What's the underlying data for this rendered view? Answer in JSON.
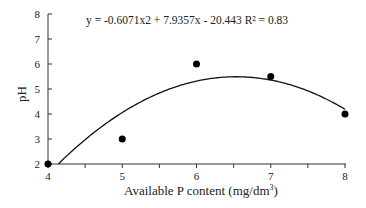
{
  "chart_data": {
    "type": "scatter",
    "title": "",
    "xlabel": "Available P content (mg/dm3)",
    "xlabel_main": "Available P content (mg/dm",
    "xlabel_sup": "3",
    "xlabel_close": ")",
    "ylabel": "pH",
    "xlim": [
      4,
      8
    ],
    "ylim": [
      2,
      8
    ],
    "x_ticks": [
      "4",
      "5",
      "6",
      "7",
      "8"
    ],
    "y_ticks": [
      "2",
      "3",
      "4",
      "5",
      "6",
      "7",
      "8"
    ],
    "grid": false,
    "legend": "none",
    "series": [
      {
        "name": "observed",
        "x": [
          4,
          5,
          6,
          7,
          8
        ],
        "y": [
          2,
          3,
          6,
          5.5,
          4
        ]
      }
    ],
    "trendline": {
      "type": "polynomial",
      "order": 2,
      "coefficients": [
        -0.6071,
        7.9357,
        -20.443
      ],
      "r2": 0.83
    },
    "annotations": [
      "y = -0.6071x2 + 7.9357x - 20.443  R² = 0.83"
    ]
  },
  "equation_text": "y = -0.6071x2 + 7.9357x - 20.443  R² = 0.83"
}
